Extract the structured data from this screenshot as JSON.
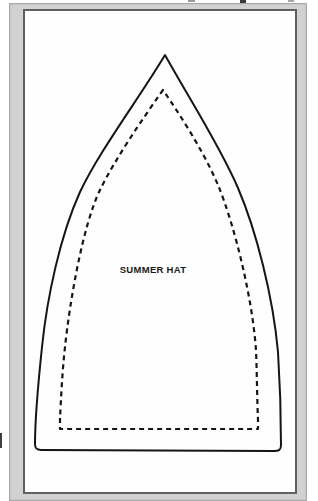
{
  "scan": {
    "background": "#ffffff",
    "mat_color": "#d2d2d2",
    "mat_edge_color": "#a8a8a8",
    "sheet_color": "#fefefe",
    "sheet_border_color": "#5f5f5f"
  },
  "pattern": {
    "label": "SUMMER HAT",
    "line_color": "#151515",
    "cut_line_width": "2",
    "seam_line_width": "2.2",
    "seam_dash": "5 4",
    "cut_line_path": "M 165,55 C 138,100 100,150 80,192 C 60,236 47,298 42,347 C 38,385 35,418 35,444 C 35,448 36,450 41,450 L 274,451 C 279,451 281,450 281,445 C 281,414 280,383 278,352 C 273,296 256,230 238,188 C 220,146 190,100 165,55 Z",
    "seam_line_path": "M 163,90 C 141,121 114,161 100,190 C 83,225 70,300 65,347 C 62,374 61,400 60,418 L 60,429 L 258,429 L 258,420 C 257,397 257,374 256,350 C 252,295 234,224 218,185 C 203,150 180,115 163,90 Z"
  }
}
